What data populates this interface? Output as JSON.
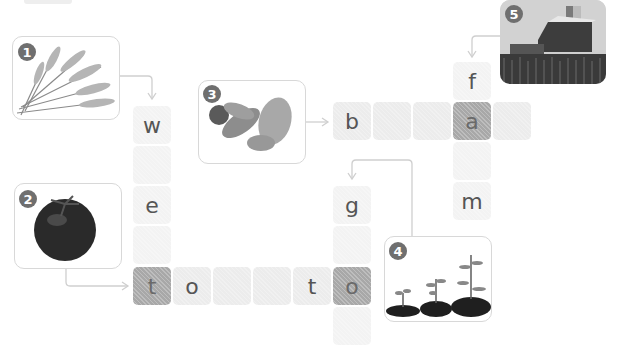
{
  "puzzle": {
    "type": "picture crossword",
    "clues": [
      {
        "number": "1",
        "picture": "wheat",
        "direction": "down"
      },
      {
        "number": "2",
        "picture": "tomato",
        "direction": "across"
      },
      {
        "number": "3",
        "picture": "bread",
        "direction": "across"
      },
      {
        "number": "4",
        "picture": "seedlings growing",
        "direction": "down"
      },
      {
        "number": "5",
        "picture": "farm with barn and silo",
        "direction": "down"
      }
    ],
    "cells": {
      "w1": "w",
      "w2": "",
      "w3": "e",
      "w4": "",
      "t1": "t",
      "t2": "o",
      "t3": "",
      "t4": "",
      "t5": "t",
      "t6": "o",
      "b1": "b",
      "b2": "",
      "b3": "",
      "b4": "a",
      "b5": "",
      "f1": "f",
      "f3": "",
      "f4": "m",
      "g1": "g",
      "g2": "",
      "g4": ""
    },
    "colors": {
      "cell": "#ececec",
      "shared_cell": "#a8a8a8",
      "arrow": "#cfcfcf",
      "badge": "#6f6f6f"
    }
  }
}
